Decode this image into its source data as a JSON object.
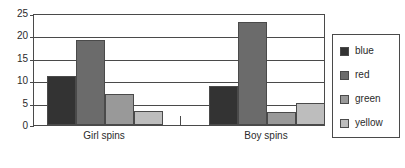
{
  "chart_data": {
    "type": "bar",
    "title": "",
    "xlabel": "",
    "ylabel": "",
    "categories": [
      "Girl spins",
      "Boy spins"
    ],
    "series": [
      {
        "name": "blue",
        "color": "#333333",
        "values": [
          11,
          8.7
        ]
      },
      {
        "name": "red",
        "color": "#6b6b6b",
        "values": [
          19,
          23
        ]
      },
      {
        "name": "green",
        "color": "#999999",
        "values": [
          7,
          3
        ]
      },
      {
        "name": "yellow",
        "color": "#bdbdbd",
        "values": [
          3.2,
          5
        ]
      }
    ],
    "ylim": [
      0,
      25
    ],
    "yticks": [
      0,
      5,
      10,
      15,
      20,
      25
    ],
    "ytick_labels": [
      "0",
      "5",
      "10",
      "15",
      "20",
      "25"
    ],
    "grid": true,
    "grid_axis": "y",
    "legend": {
      "position": "right",
      "entries": [
        {
          "label": "blue",
          "color": "#333333"
        },
        {
          "label": "red",
          "color": "#6b6b6b"
        },
        {
          "label": "green",
          "color": "#999999"
        },
        {
          "label": "yellow",
          "color": "#bdbdbd"
        }
      ]
    },
    "axis_color": "#4a4a4a",
    "background": "#ffffff"
  }
}
